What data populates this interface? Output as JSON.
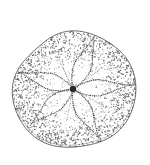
{
  "figure": {
    "title": "Echinoid test, aboral view",
    "subject_common_name": "sand dollar",
    "subject_group": "sea urchin (Echinoidea)",
    "view": "aboral (upper) surface",
    "technique": "stipple and line drawing",
    "background_color": "#ffffff",
    "ink_color": "#3a3a3a",
    "stipple_color": "#555555",
    "outline_color": "#4a4a4a",
    "canvas": {
      "width": 150,
      "height": 165
    }
  },
  "anatomy": {
    "test_outline": {
      "label": "test margin",
      "center_x": 74,
      "center_y": 90,
      "radius_x": 61,
      "radius_y": 59,
      "top_y": 32,
      "bottom_y": 150,
      "left_x": 13,
      "right_x": 135
    },
    "apical_disc": {
      "label": "apical disc",
      "cx": 73,
      "cy": 89,
      "r": 3.2,
      "color": "#2b2b2b"
    },
    "petals": [
      {
        "name": "petal-I-upper-right",
        "angle_deg": -68,
        "length": 57,
        "half_width": 7.5,
        "tip_x": 95,
        "tip_y": 37
      },
      {
        "name": "petal-II-right",
        "angle_deg": -4,
        "length": 57,
        "half_width": 7.0,
        "tip_x": 130,
        "tip_y": 85
      },
      {
        "name": "petal-III-lower-right",
        "angle_deg": 62,
        "length": 55,
        "half_width": 7.0,
        "tip_x": 99,
        "tip_y": 137
      },
      {
        "name": "petal-IV-lower-left",
        "angle_deg": 140,
        "length": 54,
        "half_width": 7.0,
        "tip_x": 32,
        "tip_y": 124
      },
      {
        "name": "petal-V-upper-left",
        "angle_deg": 197,
        "length": 56,
        "half_width": 7.0,
        "tip_x": 20,
        "tip_y": 73
      }
    ],
    "pore_rows_note": "each petal drawn as two parallel dotted pore rows",
    "stipple": {
      "label": "tubercle stippling",
      "dot_count": 2100,
      "dot_radius_min": 0.32,
      "dot_radius_max": 0.72,
      "edge_density_boost": 2.6
    }
  },
  "chart_data": {
    "type": "scatter",
    "title": "Echinoid test, aboral view",
    "xlabel": "",
    "ylabel": "",
    "series": [
      {
        "name": "petal-I-upper-right",
        "values": [
          -68,
          57
        ]
      },
      {
        "name": "petal-II-right",
        "values": [
          -4,
          57
        ]
      },
      {
        "name": "petal-III-lower-right",
        "values": [
          62,
          55
        ]
      },
      {
        "name": "petal-IV-lower-left",
        "values": [
          140,
          54
        ]
      },
      {
        "name": "petal-V-upper-left",
        "values": [
          197,
          56
        ]
      }
    ],
    "categories": [
      "angle_deg",
      "length_px"
    ]
  }
}
